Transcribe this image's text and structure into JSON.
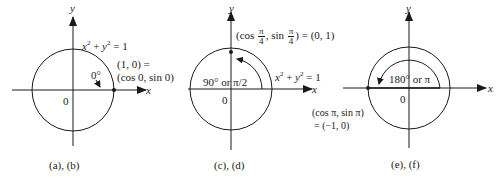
{
  "colors": {
    "ink": "#1a1a1a",
    "background": "#ffffff"
  },
  "panels": [
    {
      "id": "ab",
      "caption": "(a), (b)",
      "axis_x_label": "x",
      "axis_y_label": "y",
      "origin_label": "0",
      "equation": {
        "x": "x",
        "exp1": "2",
        "plus": " + ",
        "y": "y",
        "exp2": "2",
        "rest": " = 1"
      },
      "angle_label": "0°",
      "point_label_line1": "(1, 0) =",
      "point_label_line2": "(cos 0, sin 0)",
      "geometry": {
        "cx": 73,
        "cy": 90,
        "r": 41,
        "point": [
          114,
          90
        ]
      }
    },
    {
      "id": "cd",
      "caption": "(c), (d)",
      "axis_x_label": "x",
      "axis_y_label": "y",
      "origin_label": "0",
      "equation": {
        "x": "x",
        "exp1": "2",
        "plus": " + ",
        "y": "y",
        "exp2": "2",
        "rest": " = 1"
      },
      "angle_label": "90° or π/2",
      "point_label": {
        "open": "(cos ",
        "num1": "π",
        "den1": "4",
        "mid": ", sin ",
        "num2": "π",
        "den2": "4",
        "close": ") = (0, 1)"
      },
      "geometry": {
        "cx": 231,
        "cy": 89,
        "r": 41,
        "point": [
          231,
          52
        ]
      }
    },
    {
      "id": "ef",
      "caption": "(e), (f)",
      "axis_x_label": "x",
      "axis_y_label": "y",
      "origin_label": "0",
      "angle_label": "180° or π",
      "point_label_line1": "(cos π, sin π)",
      "point_label_line2": "= (−1, 0)",
      "geometry": {
        "cx": 409,
        "cy": 88,
        "r": 41,
        "point": [
          368,
          88
        ]
      }
    }
  ]
}
